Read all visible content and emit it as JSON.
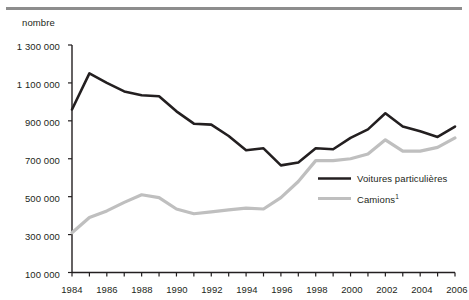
{
  "figure": {
    "unit_label": "nombre",
    "rule_color": "#8d8d8d"
  },
  "legend": {
    "items": [
      {
        "label": "Voitures particulières",
        "color": "#231f20"
      },
      {
        "label": "Camions",
        "footnote": "1",
        "color": "#bfbfbf"
      }
    ]
  },
  "axis": {
    "y_ticks": [
      "1 300 000",
      "1 100 000",
      "900 000",
      "700 000",
      "500 000",
      "300 000",
      "100 000"
    ],
    "x_ticks": [
      "1984",
      "1986",
      "1988",
      "1990",
      "1992",
      "1994",
      "1996",
      "1998",
      "2000",
      "2002",
      "2004",
      "2006"
    ]
  },
  "chart_data": {
    "type": "line",
    "title": "",
    "xlabel": "",
    "ylabel": "nombre",
    "ylim": [
      100000,
      1300000
    ],
    "xlim": [
      1984,
      2006
    ],
    "ytick_values": [
      100000,
      300000,
      500000,
      700000,
      900000,
      1100000,
      1300000
    ],
    "grid": false,
    "legend_position": "center-right-inside",
    "x": [
      1984,
      1985,
      1986,
      1987,
      1988,
      1989,
      1990,
      1991,
      1992,
      1993,
      1994,
      1995,
      1996,
      1997,
      1998,
      1999,
      2000,
      2001,
      2002,
      2003,
      2004,
      2005,
      2006
    ],
    "series": [
      {
        "name": "Voitures particulières",
        "color": "#231f20",
        "values": [
          960000,
          1150000,
          1100000,
          1055000,
          1035000,
          1030000,
          950000,
          885000,
          880000,
          820000,
          745000,
          755000,
          665000,
          680000,
          755000,
          750000,
          810000,
          855000,
          940000,
          870000,
          845000,
          815000,
          870000
        ]
      },
      {
        "name": "Camions 1",
        "color": "#bfbfbf",
        "values": [
          310000,
          390000,
          425000,
          470000,
          510000,
          495000,
          435000,
          410000,
          420000,
          430000,
          440000,
          435000,
          495000,
          580000,
          690000,
          690000,
          700000,
          725000,
          800000,
          740000,
          740000,
          760000,
          810000
        ]
      }
    ]
  }
}
